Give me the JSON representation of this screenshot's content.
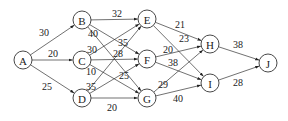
{
  "diagram": {
    "type": "directed-network",
    "nodes": [
      {
        "id": "A",
        "label": "A",
        "x": 23,
        "y": 60
      },
      {
        "id": "B",
        "label": "B",
        "x": 82,
        "y": 20
      },
      {
        "id": "C",
        "label": "C",
        "x": 82,
        "y": 60
      },
      {
        "id": "D",
        "label": "D",
        "x": 82,
        "y": 98
      },
      {
        "id": "E",
        "label": "E",
        "x": 147,
        "y": 19
      },
      {
        "id": "F",
        "label": "F",
        "x": 147,
        "y": 59
      },
      {
        "id": "G",
        "label": "G",
        "x": 147,
        "y": 98
      },
      {
        "id": "H",
        "label": "H",
        "x": 210,
        "y": 44
      },
      {
        "id": "I",
        "label": "I",
        "x": 210,
        "y": 83
      },
      {
        "id": "J",
        "label": "J",
        "x": 268,
        "y": 63
      }
    ],
    "edges": [
      {
        "from": "A",
        "to": "B",
        "weight": "30",
        "lx": 44,
        "ly": 32
      },
      {
        "from": "A",
        "to": "C",
        "weight": "20",
        "lx": 53,
        "ly": 53
      },
      {
        "from": "A",
        "to": "D",
        "weight": "25",
        "lx": 47,
        "ly": 86
      },
      {
        "from": "B",
        "to": "E",
        "weight": "32",
        "lx": 117,
        "ly": 13
      },
      {
        "from": "B",
        "to": "F",
        "weight": "35",
        "lx": 123,
        "ly": 42
      },
      {
        "from": "B",
        "to": "G",
        "weight": "40",
        "lx": 93,
        "ly": 33
      },
      {
        "from": "C",
        "to": "E",
        "weight": "30",
        "lx": 92,
        "ly": 49
      },
      {
        "from": "C",
        "to": "F",
        "weight": "28",
        "lx": 118,
        "ly": 53
      },
      {
        "from": "C",
        "to": "G",
        "weight": "10",
        "lx": 91,
        "ly": 71
      },
      {
        "from": "D",
        "to": "E",
        "weight": "35",
        "lx": 91,
        "ly": 86
      },
      {
        "from": "D",
        "to": "F",
        "weight": "25",
        "lx": 124,
        "ly": 75
      },
      {
        "from": "D",
        "to": "G",
        "weight": "20",
        "lx": 112,
        "ly": 107
      },
      {
        "from": "E",
        "to": "H",
        "weight": "21",
        "lx": 180,
        "ly": 24
      },
      {
        "from": "E",
        "to": "I",
        "weight": "23",
        "lx": 184,
        "ly": 38
      },
      {
        "from": "F",
        "to": "H",
        "weight": "20",
        "lx": 168,
        "ly": 49
      },
      {
        "from": "F",
        "to": "I",
        "weight": "38",
        "lx": 173,
        "ly": 62
      },
      {
        "from": "G",
        "to": "H",
        "weight": "29",
        "lx": 163,
        "ly": 84
      },
      {
        "from": "G",
        "to": "I",
        "weight": "40",
        "lx": 178,
        "ly": 98
      },
      {
        "from": "H",
        "to": "J",
        "weight": "38",
        "lx": 238,
        "ly": 44
      },
      {
        "from": "I",
        "to": "J",
        "weight": "28",
        "lx": 238,
        "ly": 82
      }
    ],
    "node_radius": 9,
    "stroke_color": "#333333"
  }
}
